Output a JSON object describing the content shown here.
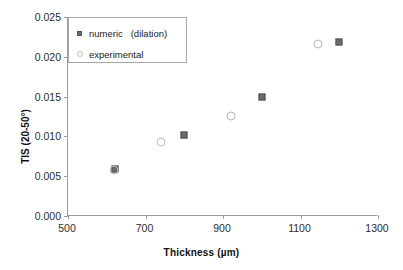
{
  "chart_data": {
    "type": "scatter",
    "title": "",
    "xlabel": "Thickness (µm)",
    "ylabel": "TIS (20-50°)",
    "xlim": [
      500,
      1300
    ],
    "ylim": [
      0.0,
      0.025
    ],
    "xticks": [
      500,
      700,
      900,
      1100,
      1300
    ],
    "yticks": [
      0.0,
      0.005,
      0.01,
      0.015,
      0.02,
      0.025
    ],
    "xtick_labels": [
      "500",
      "700",
      "900",
      "1100",
      "1300"
    ],
    "ytick_labels": [
      "0.000",
      "0.005",
      "0.010",
      "0.015",
      "0.020",
      "0.025"
    ],
    "grid": false,
    "legend_position": "upper left",
    "series": [
      {
        "name": "numeric   (dilation)",
        "marker": "filled-square",
        "color": "#6b6b6b",
        "points": [
          {
            "x": 620,
            "y": 0.0059
          },
          {
            "x": 800,
            "y": 0.0102
          },
          {
            "x": 1000,
            "y": 0.0149
          },
          {
            "x": 1200,
            "y": 0.0218
          }
        ]
      },
      {
        "name": "experimental",
        "marker": "open-circle",
        "color": "#b9b9b9",
        "points": [
          {
            "x": 618,
            "y": 0.0058
          },
          {
            "x": 740,
            "y": 0.0093
          },
          {
            "x": 920,
            "y": 0.0126
          },
          {
            "x": 1145,
            "y": 0.0216
          }
        ]
      }
    ]
  },
  "legend": {
    "entries": [
      {
        "label": "numeric   (dilation)",
        "marker": "filled-square"
      },
      {
        "label": "experimental",
        "marker": "open-circle"
      }
    ]
  },
  "axes": {
    "x_title": "Thickness (µm)",
    "y_title": "TIS (20-50°)"
  },
  "colors": {
    "numeric_marker": "#6b6b6b",
    "experimental_marker": "#b9b9b9",
    "axis_line": "#9a9a9a",
    "text": "#1a1a1a",
    "background": "#ffffff"
  }
}
